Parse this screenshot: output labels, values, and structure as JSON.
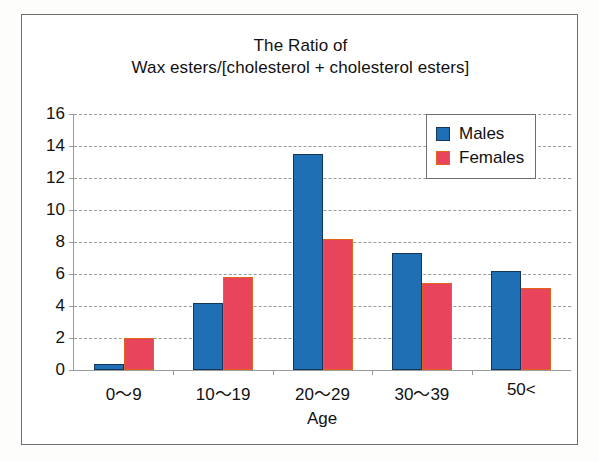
{
  "chart_data": {
    "type": "bar",
    "title": "The Ratio of Wax esters/[cholesterol + cholesterol esters]",
    "title_line_1": "The Ratio of",
    "title_line_2": "Wax esters/[cholesterol + cholesterol esters]",
    "xlabel": "Age",
    "ylabel": "",
    "categories": [
      "0〜9",
      "10〜19",
      "20〜29",
      "30〜39",
      "50<"
    ],
    "series": [
      {
        "name": "Males",
        "color": "#1F6FB5",
        "border_color": "#13355e",
        "values": [
          0.4,
          4.2,
          13.5,
          7.3,
          6.2
        ]
      },
      {
        "name": "Females",
        "color": "#E8455C",
        "border_color": "#E2631E",
        "values": [
          2.0,
          5.8,
          8.2,
          5.45,
          5.15
        ]
      }
    ],
    "ylim": [
      0,
      16
    ],
    "ytick_labels": [
      "0",
      "2",
      "4",
      "6",
      "8",
      "10",
      "12",
      "14",
      "16"
    ],
    "ytick_values": [
      0,
      2,
      4,
      6,
      8,
      10,
      12,
      14,
      16
    ],
    "grid": true,
    "grid_style": "dashed",
    "grid_color": "#9b9b9b",
    "legend_position": "top-right",
    "legend_entries": [
      "Males",
      "Females"
    ]
  }
}
